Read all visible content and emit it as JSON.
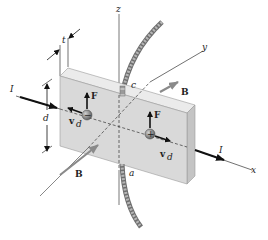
{
  "diagram": {
    "labels": {
      "current_left": "I",
      "current_right": "I",
      "thickness": "t",
      "height": "d",
      "axis_x": "x",
      "axis_y": "y",
      "axis_z": "z",
      "field_upper": "B",
      "field_lower": "B",
      "force_left": "F",
      "force_right": "F",
      "drift_left": "v",
      "drift_left_sub": "d",
      "drift_right": "v",
      "drift_right_sub": "d",
      "point_c": "c",
      "point_a": "a",
      "charge_negative": "−",
      "charge_positive": "+"
    },
    "colors": {
      "plate_front": "#d9d9d9",
      "plate_top": "#ebebeb",
      "plate_side": "#c4c4c4",
      "field_arrow": "#8a8a8a",
      "current_arrow": "#111111",
      "strip": "#9a9a9a"
    }
  }
}
